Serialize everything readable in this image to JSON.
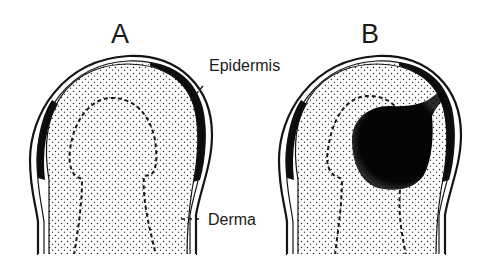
{
  "figure": {
    "panels": [
      {
        "id": "A",
        "label": "A",
        "description": "Normal finger/hair-follicle-like tip cross-section with dermal papilla outline"
      },
      {
        "id": "B",
        "label": "B",
        "description": "Same cross-section with dark mass (lesion) invading the dermis connected to epidermis"
      }
    ],
    "callouts": {
      "epidermis": "Epidermis",
      "derma": "Derma"
    },
    "colors": {
      "ink": "#141414",
      "background": "#ffffff",
      "stipple": "#2a2a2a"
    }
  }
}
